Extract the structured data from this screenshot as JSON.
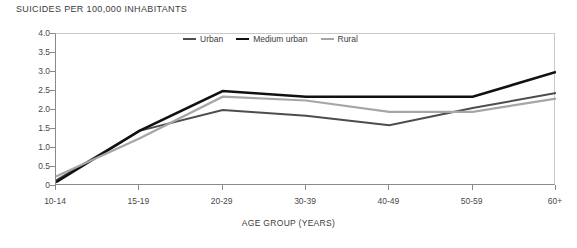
{
  "chart_data": {
    "type": "line",
    "title": "SUICIDES PER 100,000 INHABITANTS",
    "xlabel": "AGE GROUP (YEARS)",
    "ylabel": "",
    "categories": [
      "10-14",
      "15-19",
      "20-29",
      "30-39",
      "40-49",
      "50-59",
      "60+"
    ],
    "series": [
      {
        "name": "Urban",
        "color": "#4d4d4d",
        "width": 2.0,
        "values": [
          0.15,
          1.45,
          2.0,
          1.85,
          1.6,
          2.05,
          2.45
        ]
      },
      {
        "name": "Medium urban",
        "color": "#111111",
        "width": 2.6,
        "values": [
          0.1,
          1.45,
          2.5,
          2.35,
          2.35,
          2.35,
          3.0
        ]
      },
      {
        "name": "Rural",
        "color": "#a6a6a6",
        "width": 2.2,
        "values": [
          0.25,
          1.25,
          2.35,
          2.25,
          1.95,
          1.95,
          2.3
        ]
      }
    ],
    "ylim": [
      0,
      4.0
    ],
    "yticks": [
      "0",
      "0.5",
      "1.0",
      "1.5",
      "2.0",
      "2.5",
      "3.0",
      "3.5",
      "4.0"
    ],
    "ytick_values": [
      0,
      0.5,
      1.0,
      1.5,
      2.0,
      2.5,
      3.0,
      3.5,
      4.0
    ],
    "grid": false,
    "legend_position": "top-center"
  },
  "colors": {
    "axis": "#8a8a8a",
    "frame_light": "#c9c9c9",
    "text": "#3c3c3c",
    "background": "#ffffff"
  }
}
